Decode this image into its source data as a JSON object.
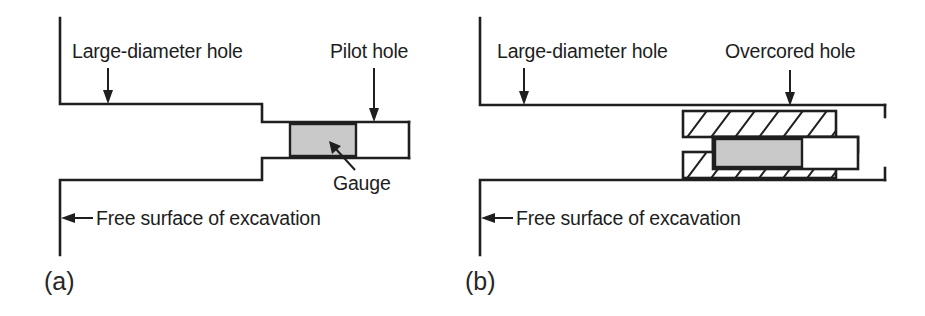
{
  "figure": {
    "caption_absent": true,
    "background_color": "#ffffff",
    "line_color": "#1f1f1f",
    "gauge_color": "#c9c9c9"
  },
  "panels": [
    {
      "id": "a",
      "label": "(a)",
      "annotations": [
        {
          "name": "large-diameter-hole",
          "text": "Large-diameter hole"
        },
        {
          "name": "pilot-hole",
          "text": "Pilot hole"
        },
        {
          "name": "gauge",
          "text": "Gauge"
        },
        {
          "name": "free-surface",
          "text": "Free surface of excavation"
        }
      ]
    },
    {
      "id": "b",
      "label": "(b)",
      "annotations": [
        {
          "name": "large-diameter-hole",
          "text": "Large-diameter hole"
        },
        {
          "name": "overcored-hole",
          "text": "Overcored hole"
        },
        {
          "name": "free-surface",
          "text": "Free surface of excavation"
        }
      ]
    }
  ],
  "labels": {
    "large_diameter_hole": "Large-diameter hole",
    "pilot_hole": "Pilot hole",
    "gauge": "Gauge",
    "free_surface": "Free surface of excavation",
    "overcored_hole": "Overcored hole",
    "panel_a": "(a)",
    "panel_b": "(b)"
  }
}
